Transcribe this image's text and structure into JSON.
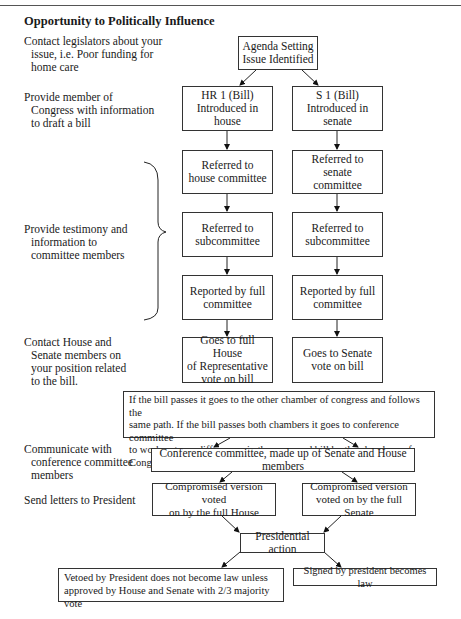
{
  "title": "Opportunity to Politically Influence",
  "notes": [
    {
      "lines": [
        "Contact legislators about your",
        "issue, i.e. Poor funding for",
        "home care"
      ]
    },
    {
      "lines": [
        "Provide member of",
        "Congress with information",
        "to draft a bill"
      ]
    },
    {
      "lines": [
        "Provide testimony and",
        "information to",
        "committee members"
      ]
    },
    {
      "lines": [
        "Contact House and",
        "Senate members on",
        "your position related",
        "to the bill."
      ]
    },
    {
      "lines": [
        "Communicate with",
        "conference committee",
        "members"
      ]
    },
    {
      "lines": [
        "Send letters to President"
      ]
    }
  ],
  "boxes": {
    "agenda": [
      "Agenda Setting",
      "Issue Identified"
    ],
    "house_intro": [
      "HR 1 (Bill)",
      "Introduced in",
      "house"
    ],
    "senate_intro": [
      "S 1 (Bill)",
      "Introduced in",
      "senate"
    ],
    "house_committee": [
      "Referred to",
      "house committee"
    ],
    "senate_committee": [
      "Referred to",
      "senate",
      "committee"
    ],
    "house_subcommittee": [
      "Referred to",
      "subcommittee"
    ],
    "senate_subcommittee": [
      "Referred to",
      "subcommittee"
    ],
    "house_reported": [
      "Reported by full",
      "committee"
    ],
    "senate_reported": [
      "Reported by full",
      "committee"
    ],
    "house_vote": [
      "Goes to full House",
      "of Representative",
      "vote on bill"
    ],
    "senate_vote": [
      "Goes to Senate",
      "vote on bill"
    ],
    "passes_note": [
      "If the bill passes it goes to the other chamber of congress and follows the",
      "same path.  If the bill passes both chambers it goes to conference committee",
      "to work out any differences in the approved bill by the chambers of Congress"
    ],
    "conference": [
      "Conference committee, made up of Senate and House members"
    ],
    "compromise_house": [
      "Compromised version voted",
      "on by the full House"
    ],
    "compromise_senate": [
      "Compromised version",
      "voted on by the full Senate"
    ],
    "presidential": [
      "Presidential action"
    ],
    "vetoed": [
      "Vetoed by President does not become law unless",
      "approved by House and Senate with 2/3 majority vote"
    ],
    "signed": [
      "Signed by president becomes law"
    ]
  }
}
